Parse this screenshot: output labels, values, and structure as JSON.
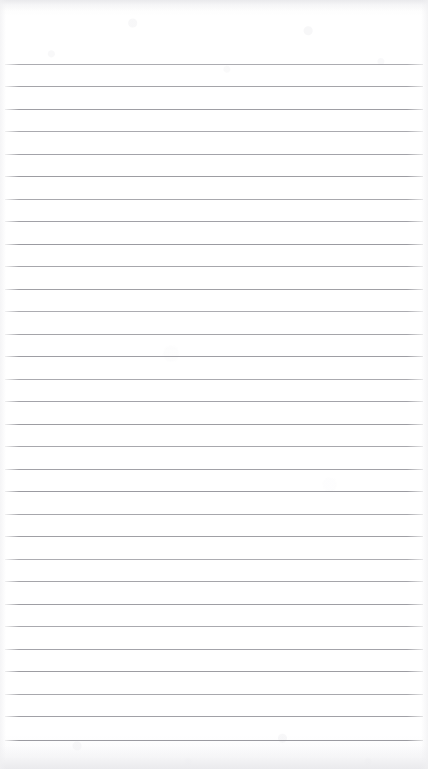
{
  "document": {
    "kind": "scanned-ruled-paper",
    "title": "Blank Ruled Notebook Page",
    "orientation": "portrait",
    "width_px": 428,
    "height_px": 769,
    "content_text": "",
    "is_blank": "true"
  },
  "paper": {
    "background_color": "#ffffff",
    "edge_shadow_color": "#eaeaed",
    "texture": "faint scan grain"
  },
  "rules": {
    "line_color": "#9a9aa0",
    "line_thickness_px": 1,
    "line_count": 31,
    "first_line_y": 64,
    "line_spacing_px": 22.5,
    "left_inset_px": 5,
    "right_inset_px": 5,
    "top_margin_px": 64,
    "bottom_margin_px": 29,
    "line_ys": [
      64,
      86,
      109,
      131,
      154,
      176,
      199,
      221,
      244,
      266,
      289,
      311,
      334,
      356,
      379,
      401,
      424,
      446,
      469,
      491,
      514,
      536,
      559,
      581,
      604,
      626,
      649,
      671,
      694,
      716,
      740
    ]
  }
}
